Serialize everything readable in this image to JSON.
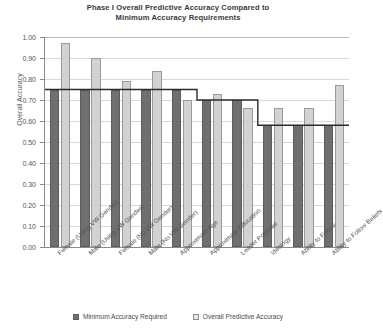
{
  "chart_data": {
    "type": "bar",
    "title": "Phase I Overall Predictive Accuracy Compared to Minimum Accuracy Requirements",
    "title_line1": "Phase I Overall Predictive Accuracy Compared to",
    "title_line2": "Minimum Accuracy Requirements",
    "xlabel": "",
    "ylabel": "Overall Accuracy",
    "ylim": [
      0.0,
      1.0
    ],
    "ytick_step": 0.1,
    "ytick_labels": [
      "1.00",
      "0.90",
      "0.80",
      "0.70",
      "0.60",
      "0.50",
      "0.40",
      "0.30",
      "0.20",
      "0.10",
      "0.00"
    ],
    "ytick_values": [
      1.0,
      0.9,
      0.8,
      0.7,
      0.6,
      0.5,
      0.4,
      0.3,
      0.2,
      0.1,
      0.0
    ],
    "grid": true,
    "legend_position": "bottom",
    "categories": [
      "Female (Using VW Gender)",
      "Male (Using VW Gender)",
      "Female (No VW Gender)",
      "Male (No VW Gender)",
      "Approximate Age",
      "Approximate Education",
      "Leader Potential",
      "Ideology",
      "Ability to Follow",
      "Ability to Follow Beliefs"
    ],
    "series": [
      {
        "name": "Minimum Accuracy Required",
        "color": "#6f6f6f",
        "values": [
          0.75,
          0.75,
          0.75,
          0.75,
          0.75,
          0.7,
          0.7,
          0.58,
          0.58,
          0.58
        ]
      },
      {
        "name": "Overall Predictive Accuracy",
        "color": "#d2d2d2",
        "values": [
          0.97,
          0.9,
          0.79,
          0.84,
          0.7,
          0.73,
          0.66,
          0.66,
          0.66,
          0.77
        ]
      }
    ]
  },
  "legend": {
    "items": [
      {
        "label": "Minimum Accuracy Required",
        "swatch": "min"
      },
      {
        "label": "Overall Predictive Accuracy",
        "swatch": "pred"
      }
    ]
  }
}
